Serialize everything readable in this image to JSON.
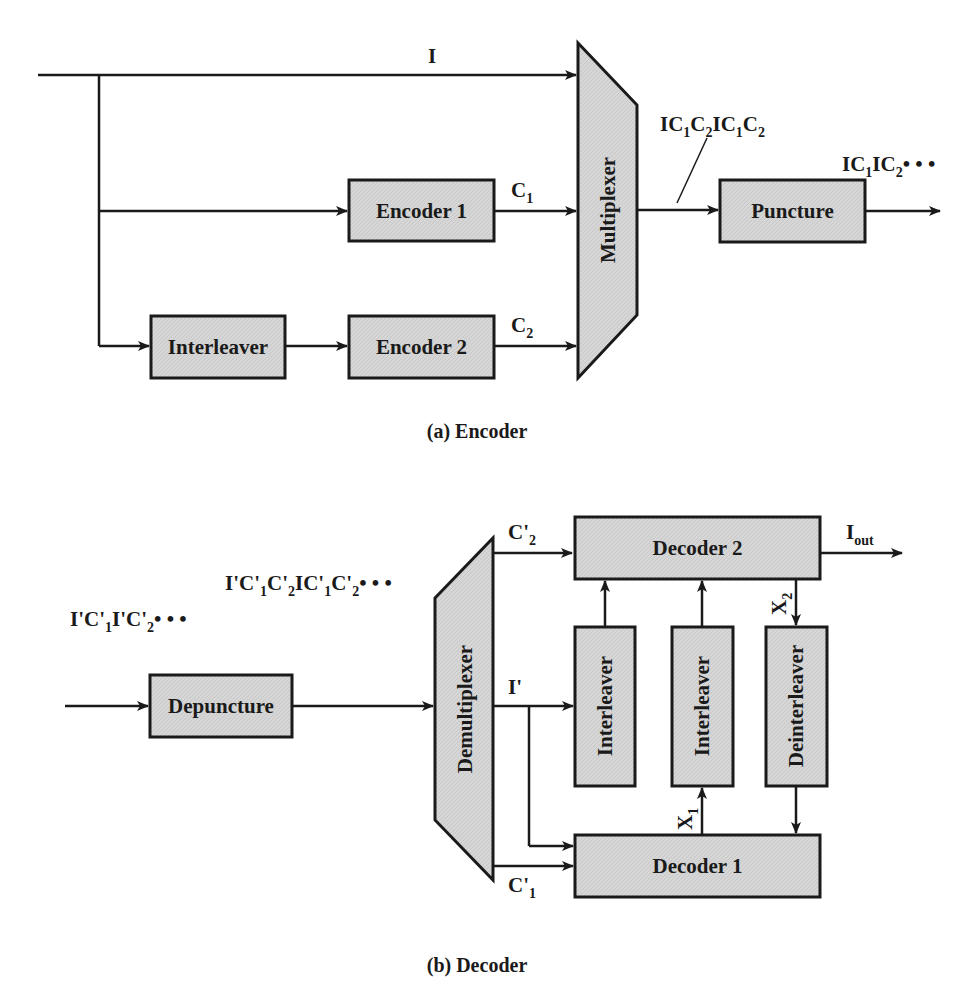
{
  "figure": {
    "encoder": {
      "caption": "(a) Encoder",
      "blocks": {
        "encoder1": "Encoder 1",
        "encoder2": "Encoder 2",
        "interleaver": "Interleaver",
        "multiplexer": "Multiplexer",
        "puncture": "Puncture"
      },
      "signals": {
        "I": {
          "base": "I"
        },
        "C1": {
          "base": "C",
          "sub": "1"
        },
        "C2": {
          "base": "C",
          "sub": "2"
        },
        "mux_out": {
          "parts": [
            {
              "t": "IC"
            },
            {
              "s": "1"
            },
            {
              "t": "C"
            },
            {
              "s": "2"
            },
            {
              "t": "IC"
            },
            {
              "s": "1"
            },
            {
              "t": "C"
            },
            {
              "s": "2"
            }
          ]
        },
        "punct_out": {
          "parts": [
            {
              "t": "IC"
            },
            {
              "s": "1"
            },
            {
              "t": "IC"
            },
            {
              "s": "2"
            },
            {
              "t": "• • •"
            }
          ]
        }
      }
    },
    "decoder": {
      "caption": "(b) Decoder",
      "blocks": {
        "depuncture": "Depuncture",
        "demultiplexer": "Demultiplexer",
        "decoder1": "Decoder 1",
        "decoder2": "Decoder 2",
        "interleaver_a": "Interleaver",
        "interleaver_b": "Interleaver",
        "deinterleaver": "Deinterleaver"
      },
      "signals": {
        "input_seq": {
          "parts": [
            {
              "t": "I'C'"
            },
            {
              "s": "1"
            },
            {
              "t": "I'C'"
            },
            {
              "s": "2"
            },
            {
              "t": "• • •"
            }
          ]
        },
        "depunct_out": {
          "parts": [
            {
              "t": "I'C'"
            },
            {
              "s": "1"
            },
            {
              "t": "C'"
            },
            {
              "s": "2"
            },
            {
              "t": "IC'"
            },
            {
              "s": "1"
            },
            {
              "t": "C'"
            },
            {
              "s": "2"
            },
            {
              "t": "• • •"
            }
          ]
        },
        "C2p": {
          "base": "C'",
          "sub": "2"
        },
        "Ip": {
          "base": "I'"
        },
        "C1p": {
          "base": "C'",
          "sub": "1"
        },
        "Iout": {
          "base": "I",
          "sub": "out"
        },
        "X1": {
          "base": "X",
          "sub": "1"
        },
        "X2": {
          "base": "X",
          "sub": "2"
        }
      }
    }
  }
}
